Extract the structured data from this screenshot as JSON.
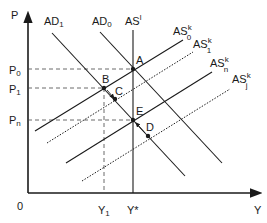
{
  "diagram": {
    "axes": {
      "y_label": "P",
      "x_label": "Y",
      "origin_label": "0"
    },
    "price_levels": [
      {
        "id": "P0",
        "base": "P",
        "sub": "0"
      },
      {
        "id": "P1",
        "base": "P",
        "sub": "1"
      },
      {
        "id": "Pn",
        "base": "P",
        "sub": "n"
      }
    ],
    "output_levels": [
      {
        "id": "Y1",
        "base": "Y",
        "sub": "1"
      },
      {
        "id": "Ystar",
        "base": "Y*"
      }
    ],
    "curves": {
      "AD1": {
        "base": "AD",
        "sub": "1"
      },
      "AD0": {
        "base": "AD",
        "sub": "0"
      },
      "ASl": {
        "base": "AS",
        "sup": "l"
      },
      "AS0k": {
        "base": "AS",
        "sup": "k",
        "sub": "0"
      },
      "AS1k": {
        "base": "AS",
        "sup": "k",
        "sub": "1"
      },
      "ASnk": {
        "base": "AS",
        "sup": "k",
        "sub": "n"
      },
      "ASjk": {
        "base": "AS",
        "sup": "k",
        "sub": "j"
      }
    },
    "points": {
      "A": "A",
      "B": "B",
      "C": "C",
      "D": "D",
      "E": "E"
    },
    "colors": {
      "line": "#1a1a1a",
      "dash": "#444444"
    }
  }
}
